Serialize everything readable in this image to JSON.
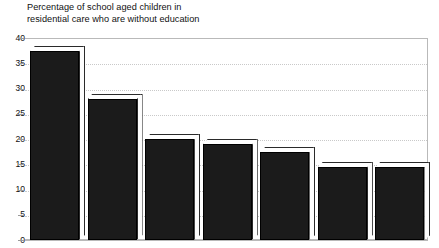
{
  "chart_data": {
    "type": "bar",
    "title": "Percentage of school aged children in\nresidential care who are without education",
    "xlabel": "",
    "ylabel": "",
    "ylim": [
      0,
      40
    ],
    "ytick_step": 5,
    "ytick_labels": [
      "40",
      "35",
      "30",
      "25",
      "20",
      "15",
      "10",
      "5",
      "0"
    ],
    "grid": true,
    "grid_style": "dotted",
    "legend": "none",
    "categories": [
      "1",
      "2",
      "3",
      "4",
      "5",
      "6",
      "7"
    ],
    "values": [
      37.5,
      28,
      20,
      19,
      17.5,
      14.5,
      14.5
    ],
    "bar_style": "3d",
    "bar_color": "#1b1b1b",
    "bar_top_color": "#ffffff",
    "series": [
      {
        "name": "Percentage without education",
        "values": [
          37.5,
          28,
          20,
          19,
          17.5,
          14.5,
          14.5
        ]
      }
    ]
  },
  "axis": {
    "ticks": [
      {
        "label": "40",
        "value": 40
      },
      {
        "label": "35",
        "value": 35
      },
      {
        "label": "30",
        "value": 30
      },
      {
        "label": "25",
        "value": 25
      },
      {
        "label": "20",
        "value": 20
      },
      {
        "label": "15",
        "value": 15
      },
      {
        "label": "10",
        "value": 10
      },
      {
        "label": "5",
        "value": 5
      },
      {
        "label": "0",
        "value": 0
      }
    ]
  }
}
